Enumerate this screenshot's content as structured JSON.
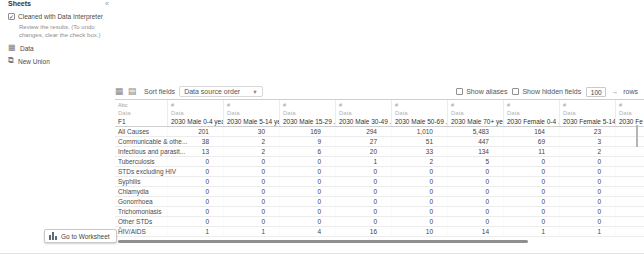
{
  "sidebar": {
    "title": "Sheets",
    "collapse_icon": "«",
    "interpreter": {
      "label": "Cleaned with Data Interpreter",
      "checked": true,
      "description": "Review the results. (To undo changes, clear the check box.)"
    },
    "items": [
      {
        "label": "Data"
      },
      {
        "label": "New Union"
      }
    ]
  },
  "toolbar": {
    "sort_label": "Sort fields",
    "sort_value": "Data source order",
    "show_aliases_label": "Show aliases",
    "show_hidden_label": "Show hidden fields",
    "rows_value": "100",
    "rows_label": "rows"
  },
  "grid": {
    "columns": [
      {
        "type": "Abc",
        "table": "Data",
        "name": "F1"
      },
      {
        "type": "#",
        "table": "Data",
        "name": "2030 Male 0-4 yea..."
      },
      {
        "type": "#",
        "table": "Data",
        "name": "2030 Male 5-14 ye..."
      },
      {
        "type": "#",
        "table": "Data",
        "name": "2030 Male 15-29 ..."
      },
      {
        "type": "#",
        "table": "Data",
        "name": "2030 Male 30-49 ..."
      },
      {
        "type": "#",
        "table": "Data",
        "name": "2030 Male 50-69 ..."
      },
      {
        "type": "#",
        "table": "Data",
        "name": "2030 Male 70+ ye..."
      },
      {
        "type": "#",
        "table": "Data",
        "name": "2030 Female 0-4 ..."
      },
      {
        "type": "#",
        "table": "Data",
        "name": "2030 Female 5-14 ..."
      },
      {
        "type": "#",
        "table": "Data",
        "name": "2030 Fe"
      }
    ],
    "rows": [
      {
        "label": "All Causes",
        "values": [
          "201",
          "30",
          "169",
          "294",
          "1,010",
          "5,483",
          "164",
          "23",
          ""
        ]
      },
      {
        "label": "Communicable & othe...",
        "values": [
          "38",
          "2",
          "9",
          "27",
          "51",
          "447",
          "69",
          "3",
          ""
        ]
      },
      {
        "label": "Infectious and parasit...",
        "values": [
          "13",
          "2",
          "6",
          "20",
          "33",
          "134",
          "11",
          "2",
          ""
        ]
      },
      {
        "label": "Tuberculosis",
        "values": [
          "0",
          "0",
          "0",
          "1",
          "2",
          "5",
          "0",
          "0",
          ""
        ]
      },
      {
        "label": "STDs excluding HIV",
        "values": [
          "0",
          "0",
          "0",
          "0",
          "0",
          "0",
          "0",
          "0",
          ""
        ]
      },
      {
        "label": "Syphilis",
        "values": [
          "0",
          "0",
          "0",
          "0",
          "0",
          "0",
          "0",
          "0",
          ""
        ]
      },
      {
        "label": "Chlamydia",
        "values": [
          "0",
          "0",
          "0",
          "0",
          "0",
          "0",
          "0",
          "0",
          ""
        ]
      },
      {
        "label": "Gonorrhoea",
        "values": [
          "0",
          "0",
          "0",
          "0",
          "0",
          "0",
          "0",
          "0",
          ""
        ]
      },
      {
        "label": "Trichomoniasis",
        "values": [
          "0",
          "0",
          "0",
          "0",
          "0",
          "0",
          "0",
          "0",
          ""
        ]
      },
      {
        "label": "Other STDs",
        "values": [
          "0",
          "0",
          "0",
          "0",
          "0",
          "0",
          "0",
          "0",
          ""
        ]
      },
      {
        "label": "HIV/AIDS",
        "values": [
          "1",
          "1",
          "4",
          "16",
          "10",
          "14",
          "1",
          "1",
          ""
        ]
      }
    ]
  },
  "footer": {
    "go_to_worksheet": "Go to Worksheet",
    "close_icon": "×",
    "go_arrow_icon": "→"
  }
}
